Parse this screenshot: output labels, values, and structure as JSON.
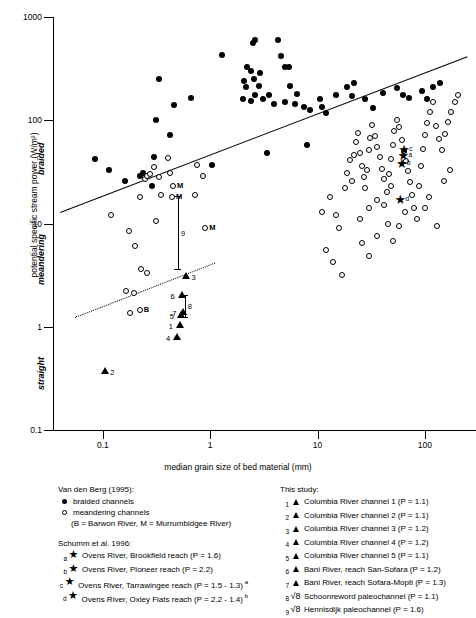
{
  "chart_data": {
    "type": "scatter",
    "title": "",
    "xlabel": "median grain size of bed material (mm)",
    "ylabel": "potential specific stream power (W/m²)",
    "xscale": "log",
    "yscale": "log",
    "xlim": [
      0.035,
      300
    ],
    "ylim": [
      0.1,
      1000
    ],
    "xticks": [
      "0.1",
      "1",
      "10",
      "100"
    ],
    "xtick_values": [
      0.1,
      1,
      10,
      100
    ],
    "yticks": [
      "1000",
      "100",
      "10",
      "1",
      "0.1"
    ],
    "ytick_values": [
      1000,
      100,
      10,
      1,
      0.1
    ],
    "grid": false,
    "legend_position": "below-plot",
    "region_labels": [
      {
        "name": "braided",
        "text": "braided"
      },
      {
        "name": "meandering",
        "text": "meandering"
      },
      {
        "name": "straight",
        "text": "straight"
      }
    ],
    "threshold_lines": [
      {
        "name": "braided-meandering-threshold",
        "style": "solid",
        "x0": 0.04,
        "y0": 13.0,
        "x1": 250,
        "y1": 420
      },
      {
        "name": "meandering-straight-threshold",
        "style": "dotted",
        "x0": 0.055,
        "y0": 1.25,
        "x1": 1.1,
        "y1": 4.2
      }
    ],
    "series": [
      {
        "name": "braided channels",
        "marker": "filled-circle",
        "points": [
          [
            0.085,
            42
          ],
          [
            0.115,
            33
          ],
          [
            0.16,
            26
          ],
          [
            0.22,
            29
          ],
          [
            0.235,
            31
          ],
          [
            0.3,
            44
          ],
          [
            0.31,
            100
          ],
          [
            0.33,
            250
          ],
          [
            0.285,
            23
          ],
          [
            0.46,
            140
          ],
          [
            0.42,
            72
          ],
          [
            0.66,
            165
          ],
          [
            2.0,
            160
          ],
          [
            1.3,
            430
          ],
          [
            2.5,
            560
          ],
          [
            2.6,
            600
          ],
          [
            2.2,
            330
          ],
          [
            2.4,
            300
          ],
          [
            2.05,
            240
          ],
          [
            2.55,
            250
          ],
          [
            2.15,
            210
          ],
          [
            2.9,
            290
          ],
          [
            2.85,
            215
          ],
          [
            2.6,
            175
          ],
          [
            2.4,
            155
          ],
          [
            3.1,
            160
          ],
          [
            3.5,
            175
          ],
          [
            4.3,
            600
          ],
          [
            4.6,
            420
          ],
          [
            5.0,
            330
          ],
          [
            5.4,
            330
          ],
          [
            5.5,
            215
          ],
          [
            6.5,
            180
          ],
          [
            5.0,
            150
          ],
          [
            3.9,
            145
          ],
          [
            6.2,
            145
          ],
          [
            7.5,
            135
          ],
          [
            8.5,
            125
          ],
          [
            10.5,
            160
          ],
          [
            11,
            135
          ],
          [
            12,
            118
          ],
          [
            15,
            175
          ],
          [
            19,
            210
          ],
          [
            22,
            230
          ],
          [
            21,
            170
          ],
          [
            28,
            160
          ],
          [
            33,
            130
          ],
          [
            41,
            185
          ],
          [
            55,
            205
          ],
          [
            62,
            175
          ],
          [
            72,
            165
          ],
          [
            95,
            190
          ],
          [
            105,
            160
          ],
          [
            120,
            210
          ],
          [
            140,
            230
          ],
          [
            1.05,
            37
          ],
          [
            3.4,
            48
          ],
          [
            8.0,
            58
          ]
        ]
      },
      {
        "name": "meandering channels",
        "marker": "open-circle",
        "points": [
          [
            0.12,
            12
          ],
          [
            0.175,
            8.5
          ],
          [
            0.2,
            6.0
          ],
          [
            0.22,
            18
          ],
          [
            0.245,
            27
          ],
          [
            0.255,
            29
          ],
          [
            0.275,
            30
          ],
          [
            0.3,
            35
          ],
          [
            0.33,
            28
          ],
          [
            0.35,
            19
          ],
          [
            0.4,
            43
          ],
          [
            0.42,
            31
          ],
          [
            0.31,
            10.5
          ],
          [
            0.225,
            3.6
          ],
          [
            0.26,
            3.3
          ],
          [
            0.165,
            2.2
          ],
          [
            0.195,
            2.1
          ],
          [
            0.75,
            37
          ],
          [
            0.85,
            29
          ],
          [
            0.72,
            19
          ],
          [
            0.18,
            1.35
          ],
          [
            11,
            13
          ],
          [
            13,
            18
          ],
          [
            15,
            12
          ],
          [
            16,
            9.0
          ],
          [
            18,
            22
          ],
          [
            19,
            31
          ],
          [
            20,
            41
          ],
          [
            21,
            26
          ],
          [
            22,
            46
          ],
          [
            23,
            62
          ],
          [
            24,
            76
          ],
          [
            25,
            48
          ],
          [
            26,
            36
          ],
          [
            27,
            28
          ],
          [
            28,
            22
          ],
          [
            29,
            33
          ],
          [
            30,
            52
          ],
          [
            31,
            68
          ],
          [
            32,
            90
          ],
          [
            34,
            70
          ],
          [
            36,
            55
          ],
          [
            38,
            44
          ],
          [
            40,
            34
          ],
          [
            42,
            27
          ],
          [
            44,
            20
          ],
          [
            46,
            30
          ],
          [
            48,
            42
          ],
          [
            50,
            58
          ],
          [
            52,
            78
          ],
          [
            55,
            100
          ],
          [
            58,
            86
          ],
          [
            61,
            64
          ],
          [
            64,
            50
          ],
          [
            67,
            40
          ],
          [
            70,
            32
          ],
          [
            73,
            25
          ],
          [
            76,
            19
          ],
          [
            80,
            14
          ],
          [
            84,
            11
          ],
          [
            88,
            23
          ],
          [
            92,
            36
          ],
          [
            96,
            53
          ],
          [
            100,
            72
          ],
          [
            105,
            95
          ],
          [
            112,
            120
          ],
          [
            120,
            150
          ],
          [
            128,
            88
          ],
          [
            136,
            66
          ],
          [
            145,
            52
          ],
          [
            155,
            74
          ],
          [
            165,
            96
          ],
          [
            175,
            120
          ],
          [
            190,
            150
          ],
          [
            205,
            175
          ],
          [
            12,
            5.5
          ],
          [
            14,
            4.2
          ],
          [
            17,
            3.2
          ],
          [
            26,
            6.5
          ],
          [
            30,
            4.8
          ],
          [
            36,
            7.5
          ],
          [
            45,
            10
          ],
          [
            50,
            6.8
          ],
          [
            58,
            9.5
          ],
          [
            66,
            13
          ],
          [
            100,
            14
          ],
          [
            110,
            18
          ],
          [
            130,
            9.5
          ],
          [
            150,
            26
          ],
          [
            170,
            33
          ],
          [
            42,
            15
          ],
          [
            48,
            23
          ],
          [
            36,
            17
          ],
          [
            30,
            14
          ],
          [
            25,
            11
          ]
        ]
      },
      {
        "name": "this-study-triangles",
        "marker": "filled-triangle",
        "points": [
          {
            "id": "1",
            "x": 0.52,
            "y": 1.05,
            "label": "1"
          },
          {
            "id": "2",
            "x": 0.105,
            "y": 0.37,
            "label": "2"
          },
          {
            "id": "3",
            "x": 0.6,
            "y": 3.1,
            "label": "3"
          },
          {
            "id": "4",
            "x": 0.49,
            "y": 0.8,
            "label": "4"
          },
          {
            "id": "5",
            "x": 0.53,
            "y": 1.3,
            "label": "5"
          },
          {
            "id": "6",
            "x": 0.54,
            "y": 2.05,
            "label": "6"
          },
          {
            "id": "7",
            "x": 0.56,
            "y": 1.4,
            "label": "7"
          }
        ]
      },
      {
        "name": "murrumbidgee-markers",
        "marker": "open-circle-label",
        "points": [
          {
            "x": 0.45,
            "y": 23.0,
            "label": "M"
          },
          {
            "x": 0.44,
            "y": 18.0,
            "label": "M"
          },
          {
            "x": 0.9,
            "y": 9.0,
            "label": "M"
          }
        ]
      },
      {
        "name": "barwon-marker",
        "marker": "open-circle-label",
        "points": [
          {
            "x": 0.22,
            "y": 1.45,
            "label": "B"
          }
        ]
      },
      {
        "name": "schumm-stars",
        "marker": "star",
        "points": [
          {
            "id": "a",
            "x": 62,
            "y": 45,
            "label": "a"
          },
          {
            "id": "b",
            "x": 60,
            "y": 38,
            "label": "b"
          },
          {
            "id": "c",
            "x": 63,
            "y": 52,
            "label": "c"
          },
          {
            "id": "d",
            "x": 58,
            "y": 17,
            "label": "d"
          }
        ]
      },
      {
        "name": "error-bars",
        "marker": "vertical-error-bar",
        "points": [
          {
            "id": "9",
            "x": 0.5,
            "ylow": 3.6,
            "yhigh": 18.5,
            "label": "9"
          },
          {
            "id": "8",
            "x": 0.58,
            "ylow": 1.25,
            "yhigh": 2.05,
            "label": "8"
          }
        ]
      }
    ]
  },
  "legend": {
    "left": {
      "head1": "Van den Berg (1995):",
      "rows1": [
        {
          "key": "filled-circle",
          "text": "braided channels"
        },
        {
          "key": "open-circle",
          "text": "meandering channels"
        }
      ],
      "note": "(B = Barwon River,  M = Murrumbidgee River)",
      "head2": "Schumm et al. 1996:",
      "rows2": [
        {
          "n": "a",
          "key": "star",
          "text": "Ovens River, Brookfield reach (P = 1.6)"
        },
        {
          "n": "b",
          "key": "star",
          "text": "Ovens River, Pioneer reach (P = 2.2)"
        },
        {
          "n": "c",
          "key": "star",
          "text": "Ovens River, Tarrawingee reach (P = 1.5 - 1.3)",
          "sup": "a"
        },
        {
          "n": "d",
          "key": "star",
          "text": "Ovens River, Oxley Flats reach (P = 2.2 - 1.4)",
          "sup": "b"
        }
      ]
    },
    "right": {
      "head1": "This study:",
      "rows1": [
        {
          "n": "1",
          "key": "triangle",
          "text": "Columbia River channel 1 (P = 1.1)"
        },
        {
          "n": "2",
          "key": "triangle",
          "text": "Columbia River channel 2 (P = 1.1)"
        },
        {
          "n": "3",
          "key": "triangle",
          "text": "Columbia River channel 3 (P = 1.2)"
        },
        {
          "n": "4",
          "key": "triangle",
          "text": "Columbia River channel 4 (P = 1.2)"
        },
        {
          "n": "5",
          "key": "triangle",
          "text": "Columbia River channel 5 (P = 1.1)"
        },
        {
          "n": "6",
          "key": "triangle",
          "text": "Bani River, reach San-Sofara (P = 1.2)"
        },
        {
          "n": "7",
          "key": "triangle",
          "text": "Bani River, reach Sofara-Mopti (P = 1.3)"
        },
        {
          "n": "8",
          "key": "ibar",
          "text": "Schoonreword paleochannel (P = 1.1)"
        },
        {
          "n": "9",
          "key": "ibar",
          "text": "Hennisdijk paleochannel (P = 1.6)"
        }
      ]
    }
  }
}
